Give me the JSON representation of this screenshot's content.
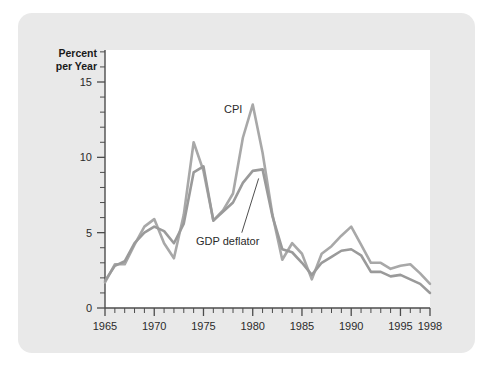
{
  "figure": {
    "card_color": "#e9e9e9",
    "plot_background": "#ffffff",
    "page_background": "#ffffff"
  },
  "axis_titles": {
    "y_line1": "Percent",
    "y_line2": "per Year"
  },
  "series_labels": {
    "cpi": "CPI",
    "gdp_deflator": "GDP deflator"
  },
  "chart_data": {
    "type": "line",
    "title": "",
    "xlabel": "",
    "ylabel": "Percent per Year",
    "xlim": [
      1965,
      1998
    ],
    "ylim": [
      0,
      15
    ],
    "grid": false,
    "legend_position": "inline-annotations",
    "x_tick_labels": [
      "1965",
      "1970",
      "1975",
      "1980",
      "1985",
      "1990",
      "1995",
      "1998"
    ],
    "x_tick_values": [
      1965,
      1970,
      1975,
      1980,
      1985,
      1990,
      1995,
      1998
    ],
    "x_minor_tick_interval": 1,
    "y_tick_labels": [
      "0",
      "5",
      "10",
      "15"
    ],
    "y_tick_values": [
      0,
      5,
      10,
      15
    ],
    "y_minor_tick_interval": 1,
    "x": [
      1965,
      1966,
      1967,
      1968,
      1969,
      1970,
      1971,
      1972,
      1973,
      1974,
      1975,
      1976,
      1977,
      1978,
      1979,
      1980,
      1981,
      1982,
      1983,
      1984,
      1985,
      1986,
      1987,
      1988,
      1989,
      1990,
      1991,
      1992,
      1993,
      1994,
      1995,
      1996,
      1997,
      1998
    ],
    "series": [
      {
        "name": "CPI",
        "color": "#a8a8a8",
        "values": [
          1.7,
          2.9,
          2.9,
          4.2,
          5.4,
          5.9,
          4.3,
          3.3,
          6.2,
          11.0,
          9.1,
          5.8,
          6.5,
          7.6,
          11.3,
          13.5,
          10.3,
          6.2,
          3.2,
          4.3,
          3.6,
          1.9,
          3.6,
          4.1,
          4.8,
          5.4,
          4.2,
          3.0,
          3.0,
          2.6,
          2.8,
          2.9,
          2.3,
          1.6
        ]
      },
      {
        "name": "GDP deflator",
        "color": "#9a9a9a",
        "values": [
          1.8,
          2.8,
          3.1,
          4.3,
          5.0,
          5.4,
          5.1,
          4.3,
          5.6,
          9.0,
          9.4,
          5.8,
          6.4,
          7.0,
          8.3,
          9.1,
          9.2,
          6.1,
          3.9,
          3.7,
          3.0,
          2.2,
          3.0,
          3.4,
          3.8,
          3.9,
          3.5,
          2.4,
          2.4,
          2.1,
          2.2,
          1.9,
          1.6,
          1.0
        ]
      }
    ],
    "annotations": [
      {
        "text": "CPI",
        "x": 1977.5,
        "y": 12.2,
        "points_to": null
      },
      {
        "text": "GDP deflator",
        "x": 1973.0,
        "y": 4.6,
        "points_to": {
          "x": 1980.6,
          "y": 8.6
        }
      }
    ]
  }
}
